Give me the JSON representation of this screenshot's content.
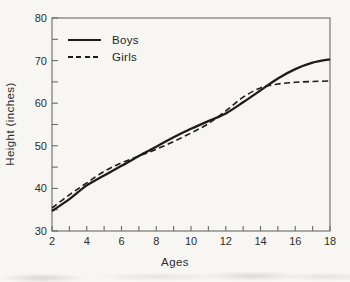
{
  "figure": {
    "background": "#f7f6f2",
    "ink": "#1c1c1c",
    "axis_color": "#6a6a6a",
    "text_color": "#2d2d2d"
  },
  "chart_data": {
    "type": "line",
    "title": "",
    "xlabel": "Ages",
    "ylabel": "Height (inches)",
    "xlim": [
      2,
      18
    ],
    "ylim": [
      30,
      80
    ],
    "x_major_ticks": [
      2,
      4,
      6,
      8,
      10,
      12,
      14,
      16,
      18
    ],
    "x_minor_ticks": [
      3,
      5,
      7,
      9,
      11,
      13,
      15,
      17
    ],
    "y_major_ticks": [
      30,
      40,
      50,
      60,
      70,
      80
    ],
    "y_minor_ticks": [
      35,
      45,
      55,
      65,
      75
    ],
    "grid": false,
    "frame": "full-box",
    "legend": {
      "position": "upper-left-inside",
      "entries": [
        {
          "label": "Boys",
          "line_style": "solid"
        },
        {
          "label": "Girls",
          "line_style": "dashed"
        }
      ]
    },
    "x": [
      2,
      3,
      4,
      5,
      6,
      7,
      8,
      9,
      10,
      11,
      12,
      13,
      14,
      15,
      16,
      17,
      18
    ],
    "series": [
      {
        "name": "Boys",
        "line_style": "solid",
        "values": [
          34.7,
          37.5,
          40.7,
          43.0,
          45.3,
          47.6,
          49.8,
          52.0,
          54.0,
          55.8,
          57.6,
          60.2,
          63.0,
          65.8,
          68.0,
          69.5,
          70.3
        ]
      },
      {
        "name": "Girls",
        "line_style": "dashed",
        "values": [
          35.4,
          38.5,
          41.3,
          44.0,
          46.0,
          47.6,
          49.2,
          51.0,
          53.0,
          55.2,
          58.2,
          61.4,
          63.6,
          64.5,
          64.9,
          65.1,
          65.2
        ]
      }
    ]
  }
}
